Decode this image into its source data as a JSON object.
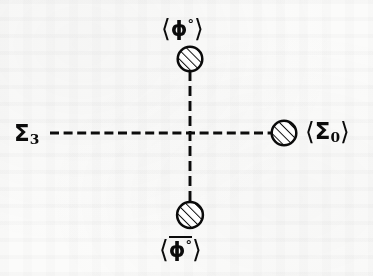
{
  "figure": {
    "kind": "vacuum-expectation-value vertex diagram",
    "background_color": "#fbfbfa",
    "ink_color": "#0b0b0b",
    "center": {
      "x": 190,
      "y": 133
    },
    "labels": {
      "top": {
        "bra": "⟨",
        "symbol": "ϕ",
        "superscript": "°",
        "ket": "⟩",
        "overbar": false
      },
      "bottom": {
        "bra": "⟨",
        "symbol": "ϕ",
        "superscript": "°",
        "ket": "⟩",
        "overbar": true
      },
      "left": {
        "bra": "",
        "symbol": "Σ",
        "subscript": "3",
        "ket": ""
      },
      "right": {
        "bra": "⟨",
        "symbol": "Σ",
        "subscript": "0",
        "ket": "⟩"
      }
    },
    "blobs": [
      {
        "name": "blob-top",
        "cx": 190,
        "cy": 59,
        "r": 12.5
      },
      {
        "name": "blob-bottom",
        "cx": 190,
        "cy": 215,
        "r": 13.0
      },
      {
        "name": "blob-right",
        "cx": 284,
        "cy": 133,
        "r": 12.5
      }
    ],
    "dashed_lines": [
      {
        "name": "horizontal-propagator",
        "x1": 50,
        "y1": 133,
        "x2": 271,
        "y2": 133,
        "dash": 9,
        "gap": 4.5
      },
      {
        "name": "vertical-propagator",
        "x1": 190,
        "y1": 72,
        "x2": 190,
        "y2": 202,
        "dash": 10,
        "gap": 5
      }
    ],
    "hatch": {
      "angle_deg": 45,
      "spacing": 4.6,
      "stroke_width": 1.9
    },
    "stroke_width": 2.4
  }
}
